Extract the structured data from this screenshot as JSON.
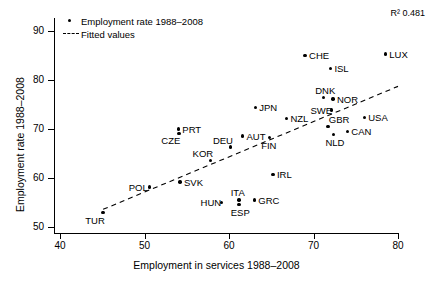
{
  "chart_data": {
    "type": "scatter",
    "title": "",
    "xlabel": "Employment in services 1988–2008",
    "ylabel": "Employment rate 1988–2008",
    "xlim": [
      40,
      80
    ],
    "ylim": [
      50,
      90
    ],
    "xticks": [
      "40",
      "50",
      "60",
      "70",
      "80"
    ],
    "yticks": [
      "50",
      "60",
      "70",
      "80",
      "90"
    ],
    "xtick_values": [
      40,
      50,
      60,
      70,
      80
    ],
    "ytick_values": [
      50,
      60,
      70,
      80,
      90
    ],
    "grid": false,
    "annotation": "R² 0.481",
    "legend_position": "top-left",
    "legend": [
      {
        "label": "Employment rate 1988–2008",
        "marker": "dot"
      },
      {
        "label": "Fitted values",
        "marker": "dashed-line"
      }
    ],
    "series": [
      {
        "name": "Employment rate 1988–2008",
        "marker": "dot",
        "color": "#000000",
        "points": [
          {
            "label": "TUR",
            "x": 45.1,
            "y": 52.9,
            "label_pos": "below-left"
          },
          {
            "label": "POL",
            "x": 50.6,
            "y": 58.2,
            "label_pos": "left"
          },
          {
            "label": "SVK",
            "x": 54.2,
            "y": 59.2,
            "label_pos": "right"
          },
          {
            "label": "PRT",
            "x": 54.0,
            "y": 70.0,
            "label_pos": "right"
          },
          {
            "label": "CZE",
            "x": 54.1,
            "y": 69.1,
            "label_pos": "below-left"
          },
          {
            "label": "KOR",
            "x": 57.8,
            "y": 63.6,
            "label_pos": "above-left"
          },
          {
            "label": "HUN",
            "x": 59.1,
            "y": 55.0,
            "label_pos": "left"
          },
          {
            "label": "DEU",
            "x": 60.2,
            "y": 66.3,
            "label_pos": "above-left"
          },
          {
            "label": "ITA",
            "x": 61.2,
            "y": 55.5,
            "label_pos": "above"
          },
          {
            "label": "ESP",
            "x": 61.2,
            "y": 54.6,
            "label_pos": "below"
          },
          {
            "label": "AUT",
            "x": 61.6,
            "y": 68.6,
            "label_pos": "right"
          },
          {
            "label": "GRC",
            "x": 63.0,
            "y": 55.5,
            "label_pos": "right"
          },
          {
            "label": "JPN",
            "x": 63.1,
            "y": 74.4,
            "label_pos": "right"
          },
          {
            "label": "FIN",
            "x": 64.8,
            "y": 68.3,
            "label_pos": "below"
          },
          {
            "label": "IRL",
            "x": 65.2,
            "y": 60.7,
            "label_pos": "right"
          },
          {
            "label": "NZL",
            "x": 66.8,
            "y": 72.2,
            "label_pos": "right"
          },
          {
            "label": "CHE",
            "x": 69.0,
            "y": 85.0,
            "label_pos": "right"
          },
          {
            "label": "DNK",
            "x": 71.2,
            "y": 76.4,
            "label_pos": "above"
          },
          {
            "label": "SWE",
            "x": 72.1,
            "y": 73.9,
            "label_pos": "left"
          },
          {
            "label": "NOR",
            "x": 72.3,
            "y": 76.1,
            "label_pos": "right"
          },
          {
            "label": "ISL",
            "x": 72.0,
            "y": 82.4,
            "label_pos": "right"
          },
          {
            "label": "GBR",
            "x": 71.7,
            "y": 70.5,
            "label_pos": "above-right"
          },
          {
            "label": "NLD",
            "x": 72.4,
            "y": 68.9,
            "label_pos": "below"
          },
          {
            "label": "CAN",
            "x": 74.0,
            "y": 69.5,
            "label_pos": "right"
          },
          {
            "label": "USA",
            "x": 76.0,
            "y": 72.3,
            "label_pos": "right"
          },
          {
            "label": "LUX",
            "x": 78.5,
            "y": 85.3,
            "label_pos": "right"
          }
        ]
      },
      {
        "name": "Fitted values",
        "marker": "dashed-line",
        "color": "#000000",
        "line_endpoints": [
          {
            "x": 45.1,
            "y": 53.6
          },
          {
            "x": 80.0,
            "y": 78.7
          }
        ]
      }
    ]
  }
}
